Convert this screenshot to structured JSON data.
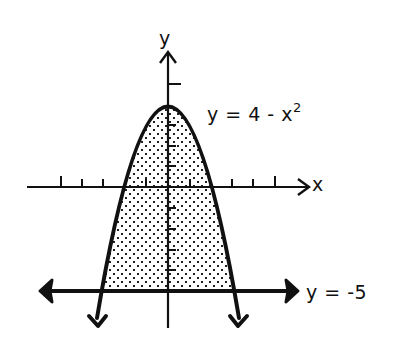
{
  "diagram": {
    "type": "region-between-curves",
    "axes": {
      "x_label": "x",
      "y_label": "y",
      "x_ticks": [
        -5,
        -4,
        -3,
        -2,
        -1,
        1,
        2,
        3,
        4,
        5
      ],
      "y_ticks": [
        5,
        3,
        2,
        1,
        -1,
        -2,
        -3,
        -4
      ]
    },
    "curves": [
      {
        "name": "parabola",
        "label_lhs": "y = 4 - x",
        "label_exp": "2",
        "equation": "y = 4 - x^2",
        "vertex": [
          0,
          4
        ],
        "x_intercepts": [
          -2,
          2
        ]
      },
      {
        "name": "horizontal-line",
        "label": "y = -5",
        "equation": "y = -5"
      }
    ],
    "shaded_region": {
      "description": "region between y = 4 - x^2 and y = -5",
      "x_range": [
        -3,
        3
      ],
      "pattern": "dots"
    },
    "colors": {
      "ink": "#111111",
      "background": "#ffffff"
    }
  }
}
